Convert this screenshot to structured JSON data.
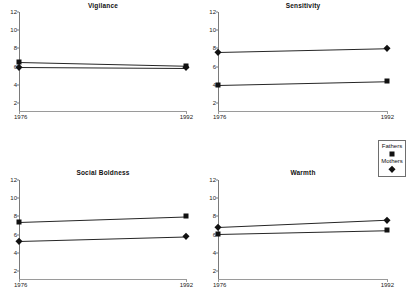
{
  "figure": {
    "background": "#ffffff",
    "marker_color": "#111111",
    "line_color": "#262626",
    "axis_color": "#7a7a7a",
    "caption": "",
    "legend": {
      "name": "series-legend",
      "entries": [
        {
          "label": "Fathers",
          "marker": "square-marker-icon"
        },
        {
          "label": "Mothers",
          "marker": "diamond-marker-icon"
        }
      ]
    }
  },
  "chart_data": [
    {
      "type": "line",
      "title": "Vigilance",
      "xlabel": "",
      "ylabel": "",
      "x": [
        1976,
        1992
      ],
      "xticklabels": [
        "1976",
        "1992"
      ],
      "yticks": [
        2,
        4,
        6,
        8,
        10,
        12
      ],
      "ylim": [
        1,
        12
      ],
      "grid": false,
      "legend_position": "figure-right",
      "series": [
        {
          "name": "Fathers",
          "marker": "square",
          "values": [
            6.5,
            6.1
          ]
        },
        {
          "name": "Mothers",
          "marker": "diamond",
          "values": [
            6.0,
            5.9
          ]
        }
      ]
    },
    {
      "type": "line",
      "title": "Sensitivity",
      "xlabel": "",
      "ylabel": "",
      "x": [
        1976,
        1992
      ],
      "xticklabels": [
        "1976",
        "1992"
      ],
      "yticks": [
        2,
        4,
        6,
        8,
        10,
        12
      ],
      "ylim": [
        1,
        12
      ],
      "grid": false,
      "legend_position": "figure-right",
      "series": [
        {
          "name": "Fathers",
          "marker": "square",
          "values": [
            4.0,
            4.4
          ]
        },
        {
          "name": "Mothers",
          "marker": "diamond",
          "values": [
            7.6,
            8.0
          ]
        }
      ]
    },
    {
      "type": "line",
      "title": "Social Boldness",
      "xlabel": "",
      "ylabel": "",
      "x": [
        1976,
        1992
      ],
      "xticklabels": [
        "1976",
        "1992"
      ],
      "yticks": [
        2,
        4,
        6,
        8,
        10,
        12
      ],
      "ylim": [
        1,
        12
      ],
      "grid": false,
      "legend_position": "figure-right",
      "series": [
        {
          "name": "Fathers",
          "marker": "square",
          "values": [
            7.4,
            8.0
          ]
        },
        {
          "name": "Mothers",
          "marker": "diamond",
          "values": [
            5.3,
            5.8
          ]
        }
      ]
    },
    {
      "type": "line",
      "title": "Warmth",
      "xlabel": "",
      "ylabel": "",
      "x": [
        1976,
        1992
      ],
      "xticklabels": [
        "1976",
        "1992"
      ],
      "yticks": [
        2,
        4,
        6,
        8,
        10,
        12
      ],
      "ylim": [
        1,
        12
      ],
      "grid": false,
      "legend_position": "figure-right",
      "series": [
        {
          "name": "Fathers",
          "marker": "square",
          "values": [
            6.1,
            6.5
          ]
        },
        {
          "name": "Mothers",
          "marker": "diamond",
          "values": [
            6.8,
            7.6
          ]
        }
      ]
    }
  ]
}
